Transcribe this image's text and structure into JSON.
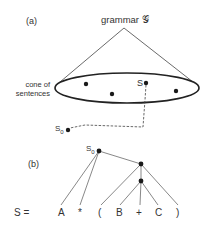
{
  "panel_a": {
    "label": "(a)",
    "title": "grammar 𝒢",
    "cone_label_line1": "cone of",
    "cone_label_line2": "sentences",
    "s_label": "S",
    "s0_label": "S",
    "s0_sub": "0"
  },
  "panel_b": {
    "label": "(b)",
    "root_label": "S",
    "root_sub": "0",
    "tokens": [
      "S =",
      "A",
      "*",
      "(",
      "B",
      "+",
      "C",
      ")"
    ]
  },
  "colors": {
    "line": "#3a3a3a",
    "dot": "#1a1a1a",
    "background": "#ffffff"
  }
}
